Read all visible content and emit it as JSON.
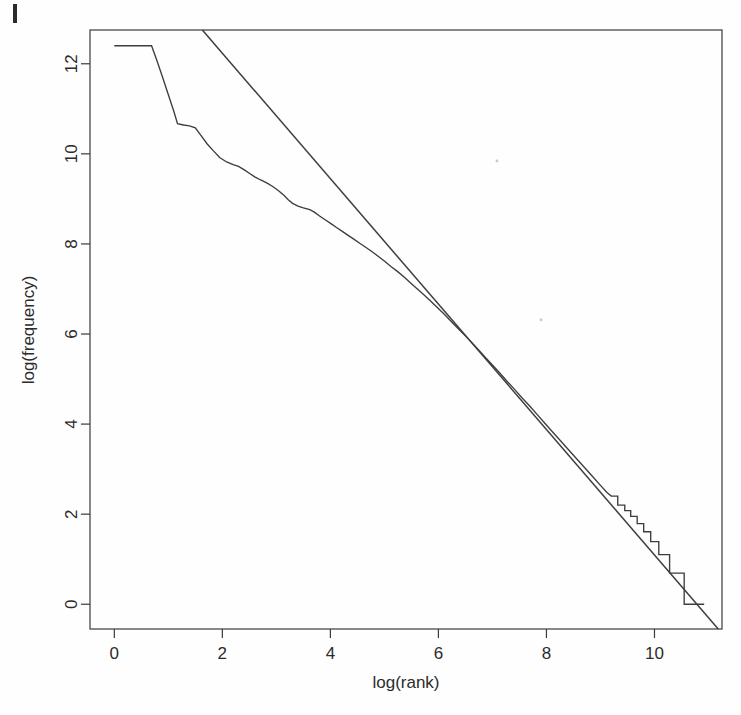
{
  "figure": {
    "background_color": "#fefefe",
    "ink_color": "#3d3d3d",
    "page_mark_label": "page-edge-mark"
  },
  "chart_data": {
    "type": "line",
    "title": "",
    "subtitle": "",
    "xlabel": "log(rank)",
    "ylabel": "log(frequency)",
    "xlim": [
      -0.45,
      11.25
    ],
    "ylim": [
      -0.55,
      12.75
    ],
    "xticks": [
      0,
      2,
      4,
      6,
      8,
      10
    ],
    "xtick_labels": [
      "0",
      "2",
      "4",
      "6",
      "8",
      "10"
    ],
    "yticks": [
      0,
      2,
      4,
      6,
      8,
      10,
      12
    ],
    "ytick_labels": [
      "0",
      "2",
      "4",
      "6",
      "8",
      "10",
      "12"
    ],
    "grid": false,
    "legend": "none",
    "box": true,
    "annotations": [],
    "series": [
      {
        "name": "empirical Zipf curve",
        "type": "step-line",
        "points": [
          [
            0.0,
            12.4
          ],
          [
            0.35,
            12.4
          ],
          [
            0.6,
            12.4
          ],
          [
            0.69,
            12.4
          ],
          [
            0.78,
            12.1
          ],
          [
            0.88,
            11.75
          ],
          [
            0.99,
            11.35
          ],
          [
            1.1,
            10.95
          ],
          [
            1.17,
            10.67
          ],
          [
            1.28,
            10.64
          ],
          [
            1.39,
            10.62
          ],
          [
            1.5,
            10.58
          ],
          [
            1.61,
            10.4
          ],
          [
            1.72,
            10.22
          ],
          [
            1.84,
            10.06
          ],
          [
            1.95,
            9.92
          ],
          [
            2.08,
            9.82
          ],
          [
            2.2,
            9.76
          ],
          [
            2.3,
            9.72
          ],
          [
            2.4,
            9.65
          ],
          [
            2.5,
            9.57
          ],
          [
            2.6,
            9.49
          ],
          [
            2.71,
            9.42
          ],
          [
            2.83,
            9.35
          ],
          [
            2.94,
            9.27
          ],
          [
            3.04,
            9.18
          ],
          [
            3.14,
            9.08
          ],
          [
            3.22,
            8.98
          ],
          [
            3.3,
            8.9
          ],
          [
            3.4,
            8.84
          ],
          [
            3.5,
            8.8
          ],
          [
            3.62,
            8.76
          ],
          [
            3.71,
            8.7
          ],
          [
            3.8,
            8.62
          ],
          [
            3.91,
            8.53
          ],
          [
            4.01,
            8.45
          ],
          [
            4.12,
            8.36
          ],
          [
            4.22,
            8.28
          ],
          [
            4.33,
            8.19
          ],
          [
            4.44,
            8.1
          ],
          [
            4.55,
            8.01
          ],
          [
            4.66,
            7.92
          ],
          [
            4.78,
            7.82
          ],
          [
            4.89,
            7.72
          ],
          [
            5.01,
            7.61
          ],
          [
            5.12,
            7.5
          ],
          [
            5.24,
            7.39
          ],
          [
            5.36,
            7.27
          ],
          [
            5.48,
            7.14
          ],
          [
            5.6,
            7.01
          ],
          [
            5.72,
            6.88
          ],
          [
            5.85,
            6.74
          ],
          [
            5.97,
            6.6
          ],
          [
            6.1,
            6.45
          ],
          [
            6.22,
            6.3
          ],
          [
            6.35,
            6.14
          ],
          [
            6.48,
            5.98
          ],
          [
            6.61,
            5.82
          ],
          [
            6.74,
            5.65
          ],
          [
            6.87,
            5.48
          ],
          [
            7.0,
            5.31
          ],
          [
            7.14,
            5.13
          ],
          [
            7.27,
            4.95
          ],
          [
            7.41,
            4.77
          ],
          [
            7.55,
            4.58
          ],
          [
            7.69,
            4.4
          ],
          [
            7.83,
            4.21
          ],
          [
            7.97,
            4.02
          ],
          [
            8.11,
            3.83
          ],
          [
            8.26,
            3.63
          ],
          [
            8.4,
            3.44
          ],
          [
            8.55,
            3.24
          ],
          [
            8.7,
            3.04
          ],
          [
            8.85,
            2.84
          ],
          [
            9.0,
            2.64
          ],
          [
            9.12,
            2.48
          ],
          [
            9.2,
            2.4
          ],
          [
            9.32,
            2.4
          ],
          [
            9.32,
            2.2
          ],
          [
            9.45,
            2.2
          ],
          [
            9.45,
            2.08
          ],
          [
            9.56,
            2.08
          ],
          [
            9.56,
            1.95
          ],
          [
            9.68,
            1.95
          ],
          [
            9.68,
            1.79
          ],
          [
            9.8,
            1.79
          ],
          [
            9.8,
            1.61
          ],
          [
            9.93,
            1.61
          ],
          [
            9.93,
            1.39
          ],
          [
            10.08,
            1.39
          ],
          [
            10.08,
            1.1
          ],
          [
            10.28,
            1.1
          ],
          [
            10.28,
            0.69
          ],
          [
            10.55,
            0.69
          ],
          [
            10.55,
            0.0
          ],
          [
            10.92,
            0.0
          ]
        ]
      },
      {
        "name": "Zipf power-law fit",
        "type": "straight-line",
        "endpoints": [
          [
            1.63,
            12.75
          ],
          [
            11.18,
            -0.55
          ]
        ],
        "slope": -1.393,
        "intercept": 15.02
      }
    ],
    "crossing_point": [
      6.2,
      6.3
    ]
  }
}
